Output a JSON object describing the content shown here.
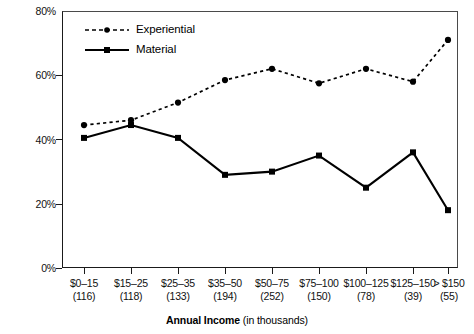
{
  "chart_data": {
    "type": "line",
    "title": "",
    "xlabel": "Annual Income (in thousands)",
    "xlabel_bold_part": "Annual Income",
    "xlabel_regular_part": "(in thousands)",
    "ylabel": "",
    "ylim": [
      0,
      80
    ],
    "yticks": [
      "0%",
      "20%",
      "40%",
      "60%",
      "80%"
    ],
    "ytick_values": [
      0,
      20,
      40,
      60,
      80
    ],
    "grid": false,
    "legend_position": "top-left",
    "categories": [
      "$0–15",
      "$15–25",
      "$25–35",
      "$35–50",
      "$50–75",
      "$75–100",
      "$100–125",
      "$125–150",
      "> $150"
    ],
    "category_counts": [
      "(116)",
      "(118)",
      "(133)",
      "(194)",
      "(252)",
      "(150)",
      "(78)",
      "(39)",
      "(55)"
    ],
    "series": [
      {
        "name": "Experiential",
        "marker": "circle",
        "line_style": "dashed",
        "color": "#000000",
        "values": [
          44.5,
          46,
          51.5,
          58.5,
          62,
          57.5,
          62,
          58,
          71
        ]
      },
      {
        "name": "Material",
        "marker": "square",
        "line_style": "solid",
        "color": "#000000",
        "values": [
          40.5,
          44.5,
          40.5,
          29,
          30,
          35,
          25,
          36,
          18
        ]
      }
    ]
  },
  "legend": {
    "items": [
      {
        "label": "Experiential"
      },
      {
        "label": "Material"
      }
    ]
  }
}
